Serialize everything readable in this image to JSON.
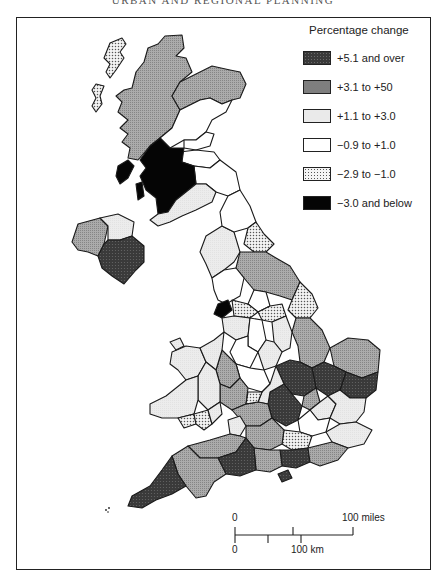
{
  "page": {
    "running_head": "URBAN AND REGIONAL PLANNING"
  },
  "legend": {
    "title": "Percentage change",
    "items": [
      {
        "key": "c1",
        "label": "+5.1 and over",
        "color": "#3a3a3a"
      },
      {
        "key": "c2",
        "label": "+3.1 to +50",
        "color": "#a8a8a8"
      },
      {
        "key": "c3",
        "label": "+1.1 to +3.0",
        "color": "#eaeaea"
      },
      {
        "key": "c4",
        "label": "−0.9 to +1.0",
        "color": "#ffffff"
      },
      {
        "key": "c5",
        "label": "−2.9 to −1.0",
        "color": "#f4f4f4"
      },
      {
        "key": "c6",
        "label": "−3.0 and below",
        "color": "#050505"
      }
    ]
  },
  "scale_bar": {
    "miles_start": "0",
    "miles_end": "100 miles",
    "km_start": "0",
    "km_end": "100 km"
  },
  "map": {
    "subject": "United Kingdom regions/counties shaded by percentage change",
    "islands_marker": "∴"
  }
}
